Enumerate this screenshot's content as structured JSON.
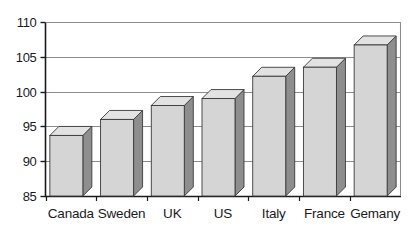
{
  "chart_data": {
    "type": "bar",
    "title": "",
    "subtitle": "",
    "xlabel": "",
    "ylabel": "",
    "categories": [
      "Canada",
      "Sweden",
      "UK",
      "US",
      "Italy",
      "France",
      "Gemany"
    ],
    "values": [
      93.7,
      96.0,
      98.0,
      99.0,
      102.2,
      103.5,
      106.7
    ],
    "ylim": [
      85,
      110
    ],
    "yticks": [
      85,
      90,
      95,
      100,
      105,
      110
    ],
    "ytick_labels": [
      "85",
      "90",
      "95",
      "100",
      "105",
      "110"
    ],
    "grid": true,
    "grid_axis": "y",
    "legend": false,
    "legend_position": "none",
    "style": "3d-bar",
    "colors": {
      "bar_front": "#d5d5d5",
      "bar_top": "#e2e2e2",
      "bar_side": "#8e8e8e",
      "bar_outline": "#3a3a3a",
      "gridline": "#8d8d8d",
      "axis": "#1a1a1a",
      "background": "#ffffff",
      "text": "#1a1a1a"
    }
  }
}
